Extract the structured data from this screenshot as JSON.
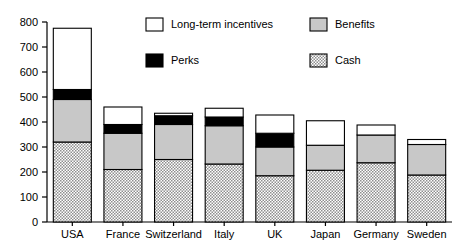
{
  "chart_data": {
    "type": "bar",
    "subtype": "stacked-bar",
    "title": "",
    "xlabel": "",
    "ylabel": "",
    "ylim": [
      0,
      800
    ],
    "ytick_step": 100,
    "yticks": [
      0,
      100,
      200,
      300,
      400,
      500,
      600,
      700,
      800
    ],
    "ytick_labels": [
      "0",
      "100",
      "200",
      "300",
      "400",
      "500",
      "600",
      "700",
      "800"
    ],
    "grid": false,
    "legend_position": "top-center",
    "categories": [
      "USA",
      "France",
      "Switzerland",
      "Italy",
      "UK",
      "Japan",
      "Germany",
      "Sweden"
    ],
    "series": [
      {
        "name": "Cash",
        "fill": "stipple",
        "color": "#cccccc",
        "values": [
          320,
          210,
          250,
          232,
          185,
          207,
          237,
          188
        ]
      },
      {
        "name": "Benefits",
        "fill": "solid-gray",
        "color": "#c8c8c8",
        "values": [
          170,
          145,
          140,
          153,
          115,
          100,
          111,
          122
        ]
      },
      {
        "name": "Perks",
        "fill": "solid-black",
        "color": "#000000",
        "values": [
          40,
          35,
          35,
          35,
          55,
          0,
          0,
          0
        ]
      },
      {
        "name": "Long-term incentives",
        "fill": "white",
        "color": "#ffffff",
        "values": [
          245,
          70,
          10,
          35,
          73,
          98,
          40,
          20
        ]
      }
    ],
    "totals": [
      775,
      460,
      435,
      455,
      428,
      405,
      388,
      330
    ],
    "stack_tops": {
      "USA": {
        "cash": 320,
        "benefits": 490,
        "perks": 530,
        "lti": 775
      },
      "France": {
        "cash": 210,
        "benefits": 355,
        "perks": 390,
        "lti": 460
      },
      "Switzerland": {
        "cash": 250,
        "benefits": 390,
        "perks": 425,
        "lti": 435
      },
      "Italy": {
        "cash": 232,
        "benefits": 385,
        "perks": 420,
        "lti": 455
      },
      "UK": {
        "cash": 185,
        "benefits": 300,
        "perks": 355,
        "lti": 428
      },
      "Japan": {
        "cash": 207,
        "benefits": 307,
        "perks": 307,
        "lti": 405
      },
      "Germany": {
        "cash": 237,
        "benefits": 348,
        "perks": 348,
        "lti": 388
      },
      "Sweden": {
        "cash": 188,
        "benefits": 310,
        "perks": 310,
        "lti": 330
      }
    },
    "legend": [
      {
        "label": "Long-term incentives",
        "fill": "white"
      },
      {
        "label": "Benefits",
        "fill": "solid-gray"
      },
      {
        "label": "Perks",
        "fill": "solid-black"
      },
      {
        "label": "Cash",
        "fill": "stipple"
      }
    ]
  }
}
